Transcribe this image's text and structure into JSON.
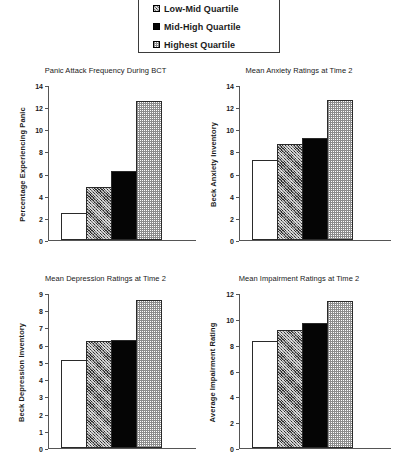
{
  "legend": {
    "name": "quartile-legend",
    "items": [
      {
        "label": "Low-Mid Quartile",
        "pattern": "hatch",
        "marker": "hatched-square-icon"
      },
      {
        "label": "Mid-High Quartile",
        "pattern": "black",
        "marker": "black-square-icon"
      },
      {
        "label": "Highest Quartile",
        "pattern": "check",
        "marker": "checkered-square-icon"
      }
    ]
  },
  "series_names": [
    "Lowest Quartile",
    "Low-Mid Quartile",
    "Mid-High Quartile",
    "Highest Quartile"
  ],
  "series_patterns": [
    "white",
    "hatch",
    "black",
    "check"
  ],
  "chart_data": [
    {
      "type": "bar",
      "title": "Panic Attack Frequency During BCT",
      "xlabel": "",
      "ylabel": "Percentage Experiencing Panic",
      "categories": [
        "Lowest Quartile",
        "Low-Mid Quartile",
        "Mid-High Quartile",
        "Highest Quartile"
      ],
      "values": [
        2.4,
        4.75,
        6.2,
        12.6
      ],
      "ylim": [
        0,
        14
      ],
      "ytick_step": 2,
      "yticks": [
        0,
        2,
        4,
        6,
        8,
        10,
        12,
        14
      ],
      "ytick_labels": [
        "0",
        "2",
        "4",
        "6",
        "8",
        "10",
        "12",
        "14"
      ],
      "grid": false,
      "legend_position": "top-center"
    },
    {
      "type": "bar",
      "title": "Mean Anxiety Ratings at Time 2",
      "xlabel": "",
      "ylabel": "Beck Anxiety Inventory",
      "categories": [
        "Lowest Quartile",
        "Low-Mid Quartile",
        "Mid-High Quartile",
        "Highest Quartile"
      ],
      "values": [
        7.2,
        8.7,
        9.2,
        12.65
      ],
      "ylim": [
        0,
        14
      ],
      "ytick_step": 2,
      "yticks": [
        0,
        2,
        4,
        6,
        8,
        10,
        12,
        14
      ],
      "ytick_labels": [
        "0",
        "2",
        "4",
        "6",
        "8",
        "10",
        "12",
        "14"
      ],
      "grid": false,
      "legend_position": "top-center"
    },
    {
      "type": "bar",
      "title": "Mean Depression Ratings at Time 2",
      "xlabel": "",
      "ylabel": "Beck Depression Inventory",
      "categories": [
        "Lowest Quartile",
        "Low-Mid Quartile",
        "Mid-High Quartile",
        "Highest Quartile"
      ],
      "values": [
        5.1,
        6.2,
        6.3,
        8.6
      ],
      "ylim": [
        0,
        9
      ],
      "ytick_step": 1,
      "yticks": [
        0,
        1,
        2,
        3,
        4,
        5,
        6,
        7,
        8,
        9
      ],
      "ytick_labels": [
        "0",
        "1",
        "2",
        "3",
        "4",
        "5",
        "6",
        "7",
        "8",
        "9"
      ],
      "grid": false,
      "legend_position": "top-center"
    },
    {
      "type": "bar",
      "title": "Mean Impairment Ratings at Time 2",
      "xlabel": "",
      "ylabel": "Average Impairment Rating",
      "categories": [
        "Lowest Quartile",
        "Low-Mid Quartile",
        "Mid-High Quartile",
        "Highest Quartile"
      ],
      "values": [
        8.25,
        9.15,
        9.65,
        11.4
      ],
      "ylim": [
        0,
        12
      ],
      "ytick_step": 2,
      "yticks": [
        0,
        2,
        4,
        6,
        8,
        10,
        12
      ],
      "ytick_labels": [
        "0",
        "2",
        "4",
        "6",
        "8",
        "10",
        "12"
      ],
      "grid": false,
      "legend_position": "top-center"
    }
  ],
  "colors": {
    "axis": "#555555",
    "bar_outline": "#2a2a2a",
    "text": "#1a1a1a",
    "background": "#ffffff"
  }
}
